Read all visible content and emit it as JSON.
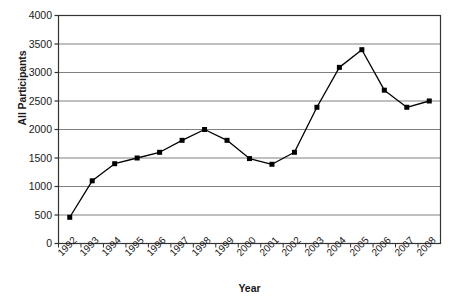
{
  "chart_data": {
    "type": "line",
    "title": "",
    "xlabel": "Year",
    "ylabel": "All Participants",
    "categories": [
      "1992",
      "1993",
      "1994",
      "1995",
      "1996",
      "1997",
      "1998",
      "1999",
      "2000",
      "2001",
      "2002",
      "2003",
      "2004",
      "2005",
      "2006",
      "2007",
      "2008"
    ],
    "values": [
      460,
      1100,
      1400,
      1500,
      1600,
      1810,
      2000,
      1810,
      1490,
      1390,
      1600,
      2390,
      3090,
      3400,
      2690,
      2390,
      2500
    ],
    "series": [
      {
        "name": "All Participants",
        "values": [
          460,
          1100,
          1400,
          1500,
          1600,
          1810,
          2000,
          1810,
          1490,
          1390,
          1600,
          2390,
          3090,
          3400,
          2690,
          2390,
          2500
        ]
      }
    ],
    "ylim": [
      0,
      4000
    ],
    "y_ticks": [
      0,
      500,
      1000,
      1500,
      2000,
      2500,
      3000,
      3500,
      4000
    ],
    "y_tick_labels": [
      "0",
      "500",
      "1000",
      "1500",
      "2000",
      "2500",
      "3000",
      "3500",
      "4000"
    ],
    "grid": true,
    "grid_axis": "y",
    "legend": false,
    "legend_position": "none",
    "marker": "square",
    "marker_color": "#000000",
    "line_color": "#000000",
    "grid_color": "#808080",
    "axis_color": "#333333",
    "background": "#ffffff",
    "x_tick_label_rotation": -45
  }
}
